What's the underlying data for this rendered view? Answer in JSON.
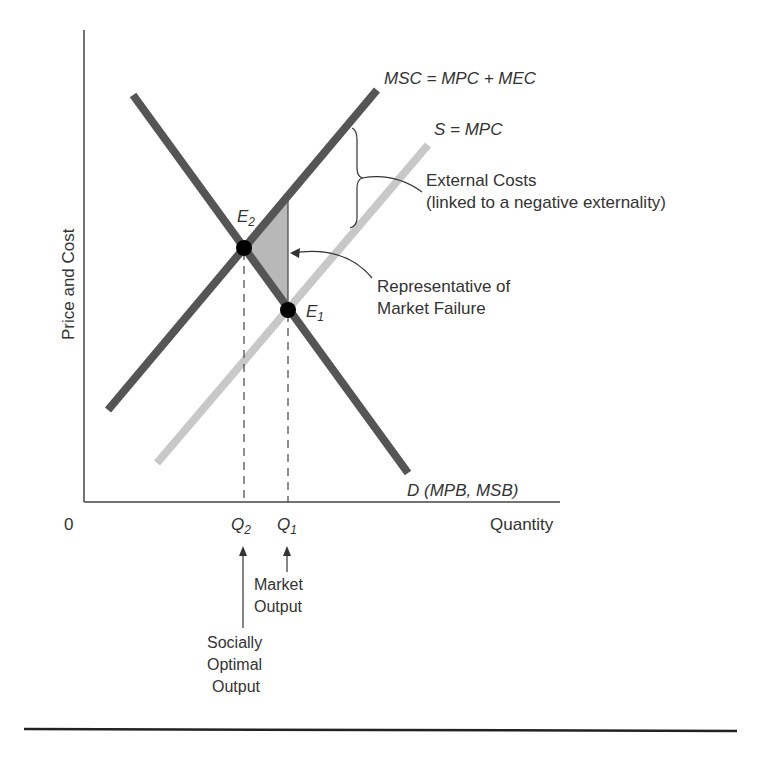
{
  "diagram": {
    "type": "economics-externality-supply-demand",
    "axes": {
      "y_label": "Price and Cost",
      "x_label": "Quantity",
      "origin": "0"
    },
    "curves": {
      "msc": {
        "label": "MSC = MPC + MEC",
        "color": "#555555"
      },
      "supply": {
        "label": "S = MPC",
        "color": "#c8c8c8"
      },
      "demand": {
        "label": "D (MPB, MSB)",
        "color": "#555555"
      }
    },
    "points": {
      "e2": {
        "label": "E",
        "sub": "2"
      },
      "e1": {
        "label": "E",
        "sub": "1"
      }
    },
    "ticks": {
      "q2": {
        "label": "Q",
        "sub": "2"
      },
      "q1": {
        "label": "Q",
        "sub": "1"
      }
    },
    "annotations": {
      "external_costs": [
        "External Costs",
        "(linked to a negative externality)"
      ],
      "market_failure": [
        "Representative of",
        "Market Failure"
      ],
      "market_output": [
        "Market",
        "Output"
      ],
      "socially_optimal": [
        "Socially",
        "Optimal",
        "Output"
      ]
    },
    "colors": {
      "deadweight_fill": "#b8b8b8",
      "axis": "#444444",
      "point": "#000000"
    }
  }
}
